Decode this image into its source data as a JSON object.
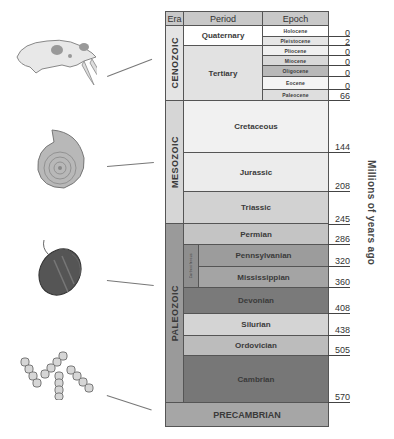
{
  "header": {
    "era": "Era",
    "period": "Period",
    "epoch": "Epoch"
  },
  "axis_label": "Millions of years ago",
  "eras": [
    {
      "name": "CENOZOIC",
      "color": "#e4e4e4"
    },
    {
      "name": "MESOZOIC",
      "color": "#d6d6d6"
    },
    {
      "name": "PALEOZOIC",
      "color": "#9a9a9a"
    },
    {
      "name": "PRECAMBRIAN",
      "color": "#a6a6a6"
    }
  ],
  "periods": [
    {
      "name": "Quaternary",
      "color": "#ffffff"
    },
    {
      "name": "Tertiary",
      "color": "#e2e2e2"
    },
    {
      "name": "Cretaceous",
      "color": "#f1f1f1"
    },
    {
      "name": "Jurassic",
      "color": "#ececec"
    },
    {
      "name": "Triassic",
      "color": "#d2d2d2"
    },
    {
      "name": "Permian",
      "color": "#c4c4c4"
    },
    {
      "name": "Carboniferous",
      "color": "#8e8e8e"
    },
    {
      "name": "Pennsylvanian",
      "color": "#9c9c9c"
    },
    {
      "name": "Mississippian",
      "color": "#a4a4a4"
    },
    {
      "name": "Devonian",
      "color": "#7a7a7a"
    },
    {
      "name": "Silurian",
      "color": "#d4d4d4"
    },
    {
      "name": "Ordovician",
      "color": "#bcbcbc"
    },
    {
      "name": "Cambrian",
      "color": "#777777"
    }
  ],
  "epochs": [
    {
      "name": "Holocene",
      "mya": "0",
      "color": "#ffffff"
    },
    {
      "name": "Pleistocene",
      "mya": "2",
      "color": "#e6e6e6"
    },
    {
      "name": "Pliocene",
      "mya": "0",
      "color": "#f0f0f0"
    },
    {
      "name": "Miocene",
      "mya": "0",
      "color": "#d8d8d8"
    },
    {
      "name": "Oligocene",
      "mya": "0",
      "color": "#b8b8b8"
    },
    {
      "name": "Eocene",
      "mya": "0",
      "color": "#f4f4f4"
    },
    {
      "name": "Paleocene",
      "mya": "66",
      "color": "#dedede"
    }
  ],
  "boundaries": [
    "144",
    "208",
    "245",
    "286",
    "320",
    "360",
    "408",
    "438",
    "505",
    "570"
  ],
  "fossils": [
    {
      "name": "saber-tooth-skull",
      "era": "CENOZOIC"
    },
    {
      "name": "ammonite",
      "era": "MESOZOIC"
    },
    {
      "name": "trilobite",
      "era": "PALEOZOIC"
    },
    {
      "name": "bacteria-chains",
      "era": "PRECAMBRIAN"
    }
  ]
}
